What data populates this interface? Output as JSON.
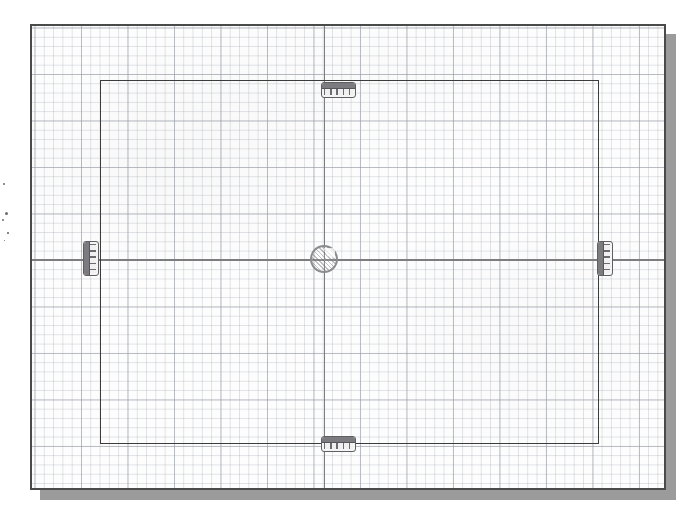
{
  "document": {
    "kind": "scanned-technical-drawing",
    "medium": "graph-paper",
    "title": "",
    "caption": ""
  },
  "canvas": {
    "width_px": 695,
    "height_px": 526,
    "background_color": "#ffffff"
  },
  "sheet": {
    "label": "graph-paper-sheet",
    "left_px": 30,
    "top_px": 24,
    "width_px": 636,
    "height_px": 466,
    "paper_color": "#fdfdfd",
    "border_color": "#4a4a4a",
    "shadow_color": "#9b9b9b",
    "shadow_offset_px": 10
  },
  "grid": {
    "label": "graph-grid",
    "fine_spacing_px": 9.3,
    "coarse_spacing_px": 46.5,
    "cells_per_major": 5,
    "fine_line_color": "#b2b7c0",
    "coarse_line_color": "#969baa"
  },
  "drawing": {
    "frame_rect": {
      "label": "outer-plate-outline",
      "left_px": 98,
      "top_px": 78,
      "width_px": 499,
      "height_px": 364,
      "line_color": "#3c3c3c",
      "line_width_px": 1.6
    },
    "centerlines": {
      "label": "centre-lines",
      "color": "#7d7d80",
      "vertical_x_px": 322,
      "horizontal_y_px": 258,
      "line_width_px": 1.7
    },
    "pivot": {
      "label": "centre-pivot-circle",
      "center_x_px": 322,
      "center_y_px": 257,
      "diameter_px": 28,
      "outline_color": "#8b8b90",
      "fill": "hatched"
    },
    "connectors": [
      {
        "label": "terminal-block-top",
        "orientation": "horizontal",
        "center_x_px": 322,
        "center_y_px": 88,
        "width_px": 35,
        "height_px": 16,
        "segments": 5,
        "outline_color": "#5e5e63"
      },
      {
        "label": "terminal-block-bottom",
        "orientation": "horizontal",
        "center_x_px": 322,
        "center_y_px": 442,
        "width_px": 35,
        "height_px": 16,
        "segments": 5,
        "outline_color": "#5e5e63"
      },
      {
        "label": "terminal-block-left",
        "orientation": "vertical",
        "center_x_px": 89,
        "center_y_px": 257,
        "width_px": 16,
        "height_px": 35,
        "segments": 5,
        "outline_color": "#5e5e63"
      },
      {
        "label": "terminal-block-right",
        "orientation": "vertical",
        "center_x_px": 603,
        "center_y_px": 257,
        "width_px": 16,
        "height_px": 35,
        "segments": 5,
        "outline_color": "#5e5e63"
      }
    ]
  },
  "margin_artifacts": {
    "label": "scan-speckles",
    "specks": [
      {
        "x_px": 3,
        "y_px": 183,
        "size_px": 2.0
      },
      {
        "x_px": 5,
        "y_px": 212,
        "size_px": 3.0
      },
      {
        "x_px": 2,
        "y_px": 219,
        "size_px": 2.2
      },
      {
        "x_px": 7,
        "y_px": 232,
        "size_px": 1.6
      },
      {
        "x_px": 4,
        "y_px": 240,
        "size_px": 1.4
      }
    ]
  }
}
